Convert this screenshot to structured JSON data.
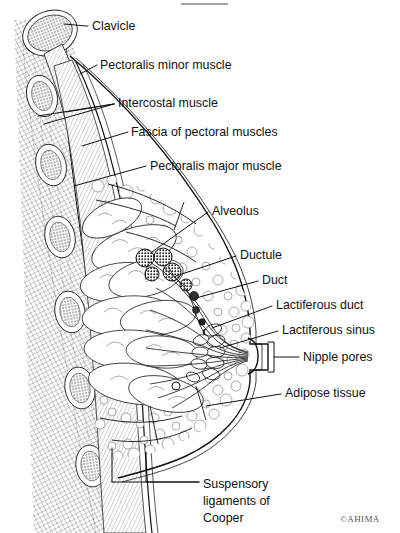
{
  "figure": {
    "copyright": "©AHIMA"
  },
  "labels": [
    {
      "id": "clavicle",
      "text": "Clavicle",
      "x": 92,
      "y": 30,
      "lines": [
        "Clavicle"
      ]
    },
    {
      "id": "pectoralis-minor",
      "text": "Pectoralis minor muscle",
      "x": 100,
      "y": 69,
      "lines": [
        "Pectoralis minor muscle"
      ]
    },
    {
      "id": "intercostal",
      "text": "Intercostal muscle",
      "x": 118,
      "y": 107,
      "lines": [
        "Intercostal muscle"
      ]
    },
    {
      "id": "fascia",
      "text": "Fascia of pectoral muscles",
      "x": 131,
      "y": 136,
      "lines": [
        "Fascia of pectoral muscles"
      ]
    },
    {
      "id": "pectoralis-major",
      "text": "Pectoralis major muscle",
      "x": 150,
      "y": 170,
      "lines": [
        "Pectoralis major muscle"
      ]
    },
    {
      "id": "alveolus",
      "text": "Alveolus",
      "x": 212,
      "y": 215,
      "lines": [
        "Alveolus"
      ]
    },
    {
      "id": "ductule",
      "text": "Ductule",
      "x": 240,
      "y": 259,
      "lines": [
        "Ductule"
      ]
    },
    {
      "id": "duct",
      "text": "Duct",
      "x": 262,
      "y": 284,
      "lines": [
        "Duct"
      ]
    },
    {
      "id": "lactiferous-duct",
      "text": "Lactiferous duct",
      "x": 276,
      "y": 309,
      "lines": [
        "Lactiferous duct"
      ]
    },
    {
      "id": "lactiferous-sinus",
      "text": "Lactiferous sinus",
      "x": 282,
      "y": 334,
      "lines": [
        "Lactiferous sinus"
      ]
    },
    {
      "id": "nipple-pores",
      "text": "Nipple pores",
      "x": 303,
      "y": 357,
      "lines": [
        "Nipple pores"
      ]
    },
    {
      "id": "adipose-tissue",
      "text": "Adipose tissue",
      "x": 285,
      "y": 397,
      "lines": [
        "Adipose tissue"
      ]
    },
    {
      "id": "suspensory-ligaments",
      "text": "Suspensory ligaments of Cooper",
      "x": 203,
      "y": 484,
      "lines": [
        "Suspensory",
        "ligaments of",
        "Cooper"
      ]
    }
  ],
  "structures": [
    {
      "id": "clavicle-bone",
      "name": "clavicle cross-section"
    },
    {
      "id": "ribs",
      "name": "rib cross-sections",
      "count": 6
    },
    {
      "id": "pectoralis-minor-muscle",
      "name": "pectoralis minor muscle band"
    },
    {
      "id": "pectoralis-major-muscle",
      "name": "pectoralis major muscle band"
    },
    {
      "id": "intercostal-muscle",
      "name": "intercostal muscle"
    },
    {
      "id": "pectoral-fascia",
      "name": "fascia of pectoral muscles"
    },
    {
      "id": "adipose",
      "name": "adipose tissue (fat lobules)"
    },
    {
      "id": "glandular-lobes",
      "name": "glandular lobes",
      "count": 9
    },
    {
      "id": "alveoli",
      "name": "alveoli clusters",
      "count": 7
    },
    {
      "id": "lactiferous-ducts",
      "name": "lactiferous ducts converging to nipple"
    },
    {
      "id": "lactiferous-sinuses",
      "name": "lactiferous sinuses",
      "count": 9
    },
    {
      "id": "nipple",
      "name": "nipple"
    },
    {
      "id": "cooper-ligaments",
      "name": "suspensory ligaments of Cooper"
    }
  ],
  "colors": {
    "ink": "#111111",
    "outline": "#222222",
    "tissue_stroke": "#666666",
    "background": "#ffffff",
    "copyright": "#555555"
  }
}
